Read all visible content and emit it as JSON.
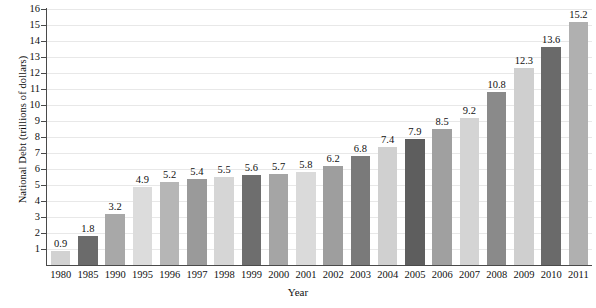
{
  "chart_data": {
    "type": "bar",
    "title": "",
    "xlabel": "Year",
    "ylabel": "National Debt (trillions of dollars)",
    "categories": [
      "1980",
      "1985",
      "1990",
      "1995",
      "1996",
      "1997",
      "1998",
      "1999",
      "2000",
      "2001",
      "2002",
      "2003",
      "2004",
      "2005",
      "2006",
      "2007",
      "2008",
      "2009",
      "2010",
      "2011"
    ],
    "values": [
      0.9,
      1.8,
      3.2,
      4.9,
      5.2,
      5.4,
      5.5,
      5.6,
      5.7,
      5.8,
      6.2,
      6.8,
      7.4,
      7.9,
      8.5,
      9.2,
      10.8,
      12.3,
      13.6,
      15.2
    ],
    "value_labels": [
      "0.9",
      "1.8",
      "3.2",
      "4.9",
      "5.2",
      "5.4",
      "5.5",
      "5.6",
      "5.7",
      "5.8",
      "6.2",
      "6.8",
      "7.4",
      "7.9",
      "8.5",
      "9.2",
      "10.8",
      "12.3",
      "13.6",
      "15.2"
    ],
    "bar_colors": [
      "#d2d2d2",
      "#6b6b6b",
      "#a8a8a8",
      "#dcdcdc",
      "#b6b6b6",
      "#9a9a9a",
      "#d6d6d6",
      "#6e6e6e",
      "#a5a5a5",
      "#dadada",
      "#9e9e9e",
      "#7a7a7a",
      "#d0d0d0",
      "#5e5e5e",
      "#a0a0a0",
      "#d4d4d4",
      "#8a8a8a",
      "#cfcfcf",
      "#6a6a6a",
      "#b0b0b0"
    ],
    "ylim": [
      0,
      16
    ],
    "ytick_labels": [
      "16",
      "15",
      "14",
      "13",
      "12",
      "11",
      "10",
      "9",
      "8",
      "7",
      "6",
      "5",
      "4",
      "3",
      "2",
      "1"
    ],
    "ytick_values": [
      16,
      15,
      14,
      13,
      12,
      11,
      10,
      9,
      8,
      7,
      6,
      5,
      4,
      3,
      2,
      1
    ],
    "grid": true,
    "legend": "none",
    "axis_color": "#4a4a4a",
    "gridline_color": "#e8e8e8",
    "background_color": "#ffffff"
  }
}
